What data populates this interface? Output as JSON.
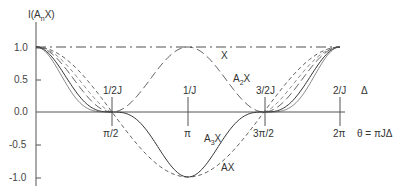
{
  "chart_data": {
    "type": "line",
    "title": "",
    "ylabel": "I(A_n X)",
    "xlabel": "θ = πJΔ",
    "secondary_xlabel": "Δ",
    "ylim": [
      -1.0,
      1.0
    ],
    "xlim": [
      0,
      6.2832
    ],
    "y_ticks": [
      {
        "value": 1.0,
        "label": "1.0"
      },
      {
        "value": 0.5,
        "label": "0.5"
      },
      {
        "value": 0.0,
        "label": "0.0"
      },
      {
        "value": -0.5,
        "label": "-0.5"
      },
      {
        "value": -1.0,
        "label": "-1.0"
      }
    ],
    "x_ticks": [
      {
        "value": 1.5708,
        "label": "π/2",
        "top_label": "1/2J"
      },
      {
        "value": 3.1416,
        "label": "π",
        "top_label": "1/J"
      },
      {
        "value": 4.7124,
        "label": "3π/2",
        "top_label": "3/2J"
      },
      {
        "value": 6.2832,
        "label": "2π",
        "top_label": "2/J"
      }
    ],
    "grid": false,
    "series": [
      {
        "name": "X",
        "style": "dash-dot",
        "formula": "1",
        "x": [
          0,
          1.5708,
          3.1416,
          4.7124,
          6.2832
        ],
        "values": [
          1.0,
          1.0,
          1.0,
          1.0,
          1.0
        ]
      },
      {
        "name": "AX",
        "style": "dashed",
        "formula": "cos θ",
        "x": [
          0,
          0.7854,
          1.5708,
          2.3562,
          3.1416,
          3.927,
          4.7124,
          5.4978,
          6.2832
        ],
        "values": [
          1.0,
          0.71,
          0.0,
          -0.71,
          -1.0,
          -0.71,
          0.0,
          0.71,
          1.0
        ]
      },
      {
        "name": "A2X",
        "style": "long-dash",
        "formula": "cos² θ",
        "x": [
          0,
          0.7854,
          1.5708,
          2.3562,
          3.1416,
          3.927,
          4.7124,
          5.4978,
          6.2832
        ],
        "values": [
          1.0,
          0.5,
          0.0,
          0.5,
          1.0,
          0.5,
          0.0,
          0.5,
          1.0
        ]
      },
      {
        "name": "A3X",
        "style": "solid",
        "formula": "cos³ θ",
        "x": [
          0,
          0.7854,
          1.5708,
          2.3562,
          3.1416,
          3.927,
          4.7124,
          5.4978,
          6.2832
        ],
        "values": [
          1.0,
          0.35,
          0.0,
          -0.35,
          -1.0,
          -0.35,
          0.0,
          0.35,
          1.0
        ]
      }
    ],
    "annotations": [
      {
        "text": "X",
        "near": "dash-dot line right of π"
      },
      {
        "text": "A2X",
        "near": "descending long-dash curve between π and 3π/2"
      },
      {
        "text": "A3X",
        "near": "solid curve right of π"
      },
      {
        "text": "AX",
        "near": "dashed curve below A3X"
      }
    ]
  },
  "labels": {
    "ylabel_main": "I(A",
    "ylabel_sub": "n",
    "ylabel_end": "X)",
    "xlabel": "θ = πJΔ",
    "delta": "Δ",
    "curve_X": "X",
    "curve_A2X_main": "A",
    "curve_A2X_sub": "2",
    "curve_A2X_end": "X",
    "curve_A3X_main": "A",
    "curve_A3X_sub": "3",
    "curve_A3X_end": "X",
    "curve_AX": "AX",
    "y1": "1.0",
    "y05": "0.5",
    "y0": "0.0",
    "ym05": "-0.5",
    "ym1": "-1.0",
    "x1": "π/2",
    "x2": "π",
    "x3": "3π/2",
    "x4": "2π",
    "t1": "1/2J",
    "t2": "1/J",
    "t3": "3/2J",
    "t4": "2/J"
  }
}
